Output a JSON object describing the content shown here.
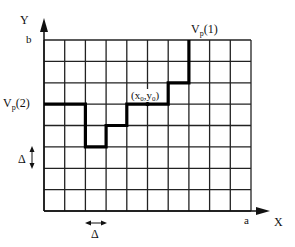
{
  "diagram": {
    "type": "grid-staircase-path",
    "axes": {
      "x_label": "X",
      "y_label": "Y",
      "x_end_label": "a",
      "y_end_label": "b"
    },
    "grid": {
      "columns": 10,
      "rows": 8,
      "left": 44,
      "top": 40,
      "right": 251,
      "bottom": 211
    },
    "labels": {
      "vp1_main": "V",
      "vp1_sub": "p",
      "vp1_arg": "(1)",
      "vp2_main": "V",
      "vp2_sub": "p",
      "vp2_arg": "(2)",
      "point_open": "(x",
      "point_x_sub": "0",
      "point_comma": ",y",
      "point_y_sub": "0",
      "point_close": ")",
      "delta_vertical": "Δ",
      "delta_horizontal": "Δ"
    },
    "path_description": "Staircase path from V_p(2) on left edge to V_p(1) on top edge passing through (x0,y0)",
    "colors": {
      "grid": "#222222",
      "path": "#000000",
      "background": "#ffffff"
    }
  }
}
